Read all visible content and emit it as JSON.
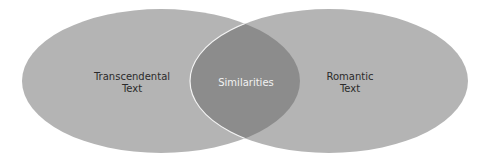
{
  "diagram": {
    "type": "venn",
    "colors": {
      "circle_fill": "#b4b4b4",
      "overlap_fill": "#8c8c8c",
      "stroke": "#ffffff",
      "background": "#ffffff"
    },
    "left": {
      "label_line1": "Transcendental",
      "label_line2": "Text"
    },
    "right": {
      "label_line1": "Romantic",
      "label_line2": "Text"
    },
    "overlap": {
      "label": "Similarities"
    }
  }
}
